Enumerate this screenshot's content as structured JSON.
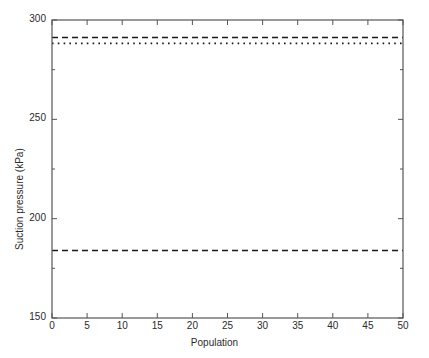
{
  "chart_data": {
    "type": "line",
    "title": "",
    "xlabel": "Population",
    "ylabel": "Suction pressure (kPa)",
    "xlim": [
      0,
      50
    ],
    "ylim": [
      150,
      300
    ],
    "xticks": [
      0,
      5,
      10,
      15,
      20,
      25,
      30,
      35,
      40,
      45,
      50
    ],
    "xticklabels": [
      "0",
      "5",
      "10",
      "15",
      "20",
      "25",
      "30",
      "35",
      "40",
      "45",
      "50"
    ],
    "yticks": [
      150,
      200,
      250,
      300
    ],
    "yticklabels": [
      "150",
      "200",
      "250",
      "300"
    ],
    "y_minor_ticks": [
      175,
      225,
      275
    ],
    "grid": false,
    "legend": null,
    "box": true,
    "tick_direction": "in",
    "line_color": "#1a1a1a",
    "axis_color": "#555555",
    "series": [
      {
        "name": "upper-dashed",
        "style": "dashed",
        "x": [
          0,
          50
        ],
        "values": [
          291.2,
          291.2
        ],
        "constant_value": 291.2
      },
      {
        "name": "dotted",
        "style": "dotted",
        "x": [
          0,
          50
        ],
        "values": [
          288.2,
          288.2
        ],
        "constant_value": 288.2
      },
      {
        "name": "lower-dashed",
        "style": "dashed",
        "x": [
          0,
          50
        ],
        "values": [
          184.0,
          184.0
        ],
        "constant_value": 184.0
      }
    ]
  }
}
